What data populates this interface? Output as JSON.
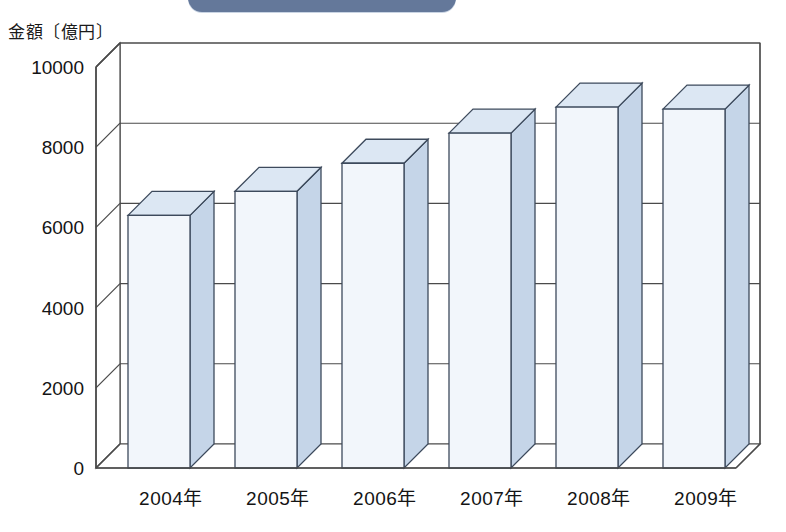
{
  "banner": {
    "label": "",
    "color": "#64789a"
  },
  "axis_title": "金額〔億円〕",
  "colors": {
    "bar_front": "#f2f6fb",
    "bar_top": "#dce7f3",
    "bar_side": "#c5d5e8",
    "bar_outline": "#3d4a5c",
    "axis_line": "#4a4a4a",
    "grid_line": "#4a4a4a",
    "banner": "#64789a"
  },
  "chart_data": {
    "type": "bar",
    "title": "",
    "subtitle": "",
    "xlabel": "",
    "ylabel": "金額〔億円〕",
    "categories": [
      "2004年",
      "2005年",
      "2006年",
      "2007年",
      "2008年",
      "2009年"
    ],
    "values": [
      6300,
      6900,
      7600,
      8350,
      9000,
      8950
    ],
    "series": [
      {
        "name": "金額",
        "values": [
          6300,
          6900,
          7600,
          8350,
          9000,
          8950
        ]
      }
    ],
    "ylim": [
      0,
      10000
    ],
    "ytick_labels": [
      "0",
      "2000",
      "4000",
      "6000",
      "8000",
      "10000"
    ],
    "ytick_values": [
      0,
      2000,
      4000,
      6000,
      8000,
      10000
    ],
    "grid": true,
    "grid_orientation": "horizontal",
    "legend": false,
    "legend_position": "none",
    "three_d": true,
    "annotations": []
  }
}
